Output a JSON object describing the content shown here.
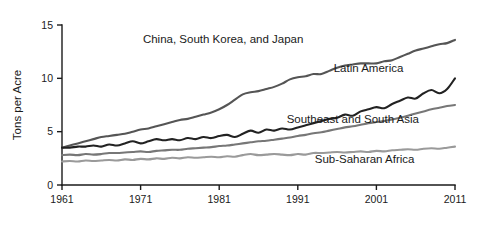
{
  "chart_data": {
    "type": "line",
    "title": "",
    "xlabel": "",
    "ylabel": "Tons per Acre",
    "xlim": [
      1961,
      2011
    ],
    "ylim": [
      0,
      15
    ],
    "grid": false,
    "legend_position": "inline-annotations",
    "x_ticks": [
      "1961",
      "1971",
      "1981",
      "1991",
      "2001",
      "2011"
    ],
    "x_tick_values": [
      1961,
      1971,
      1981,
      1991,
      2001,
      2011
    ],
    "y_ticks": [
      "0",
      "5",
      "10",
      "15"
    ],
    "y_tick_values": [
      0,
      5,
      10,
      15
    ],
    "x": [
      1961,
      1962,
      1963,
      1964,
      1965,
      1966,
      1967,
      1968,
      1969,
      1970,
      1971,
      1972,
      1973,
      1974,
      1975,
      1976,
      1977,
      1978,
      1979,
      1980,
      1981,
      1982,
      1983,
      1984,
      1985,
      1986,
      1987,
      1988,
      1989,
      1990,
      1991,
      1992,
      1993,
      1994,
      1995,
      1996,
      1997,
      1998,
      1999,
      2000,
      2001,
      2002,
      2003,
      2004,
      2005,
      2006,
      2007,
      2008,
      2009,
      2010,
      2011
    ],
    "series": [
      {
        "name": "China, South Korea, and Japan",
        "color": "#555555",
        "label_x": 1981.5,
        "label_y": 13.3,
        "values": [
          3.5,
          3.7,
          3.9,
          4.1,
          4.3,
          4.5,
          4.6,
          4.7,
          4.8,
          5.0,
          5.2,
          5.3,
          5.5,
          5.7,
          5.9,
          6.1,
          6.2,
          6.4,
          6.6,
          6.8,
          7.1,
          7.5,
          8.0,
          8.5,
          8.7,
          8.8,
          9.0,
          9.2,
          9.5,
          9.9,
          10.1,
          10.2,
          10.4,
          10.4,
          10.7,
          11.0,
          11.2,
          11.3,
          11.4,
          11.4,
          11.4,
          11.6,
          11.7,
          12.0,
          12.3,
          12.6,
          12.8,
          13.0,
          13.2,
          13.3,
          13.6
        ]
      },
      {
        "name": "Latin America",
        "color": "#222222",
        "label_x": 2000.0,
        "label_y": 10.6,
        "values": [
          3.5,
          3.5,
          3.6,
          3.6,
          3.7,
          3.6,
          3.8,
          3.7,
          3.9,
          4.1,
          3.9,
          4.1,
          4.3,
          4.2,
          4.3,
          4.2,
          4.4,
          4.3,
          4.5,
          4.4,
          4.6,
          4.7,
          4.5,
          4.8,
          5.1,
          4.9,
          5.2,
          5.1,
          5.3,
          5.2,
          5.4,
          5.6,
          5.8,
          6.0,
          6.2,
          6.3,
          6.6,
          6.5,
          6.9,
          7.1,
          7.3,
          7.2,
          7.6,
          7.9,
          8.2,
          8.1,
          8.6,
          8.9,
          8.6,
          9.0,
          10.0
        ]
      },
      {
        "name": "Southeast and South Asia",
        "color": "#777777",
        "label_x": 1998.0,
        "label_y": 5.8,
        "values": [
          2.8,
          2.85,
          2.8,
          2.9,
          2.85,
          2.9,
          3.0,
          3.0,
          3.05,
          3.1,
          3.15,
          3.1,
          3.2,
          3.25,
          3.3,
          3.3,
          3.4,
          3.45,
          3.5,
          3.55,
          3.65,
          3.7,
          3.8,
          3.9,
          4.0,
          4.1,
          4.15,
          4.25,
          4.35,
          4.45,
          4.6,
          4.7,
          4.85,
          4.95,
          5.1,
          5.25,
          5.4,
          5.5,
          5.65,
          5.8,
          5.9,
          6.0,
          6.15,
          6.3,
          6.5,
          6.7,
          6.9,
          7.1,
          7.25,
          7.4,
          7.5
        ]
      },
      {
        "name": "Sub-Saharan Africa",
        "color": "#9a9a9a",
        "label_x": 1999.5,
        "label_y": 2.1,
        "values": [
          2.2,
          2.25,
          2.2,
          2.3,
          2.25,
          2.3,
          2.35,
          2.3,
          2.4,
          2.35,
          2.45,
          2.4,
          2.5,
          2.45,
          2.55,
          2.5,
          2.6,
          2.55,
          2.6,
          2.65,
          2.6,
          2.7,
          2.65,
          2.8,
          2.9,
          2.8,
          2.85,
          2.9,
          2.85,
          2.8,
          2.9,
          2.85,
          3.0,
          3.0,
          3.05,
          3.1,
          3.05,
          3.1,
          3.15,
          3.1,
          3.2,
          3.15,
          3.25,
          3.3,
          3.35,
          3.3,
          3.4,
          3.45,
          3.4,
          3.5,
          3.6
        ]
      }
    ]
  }
}
